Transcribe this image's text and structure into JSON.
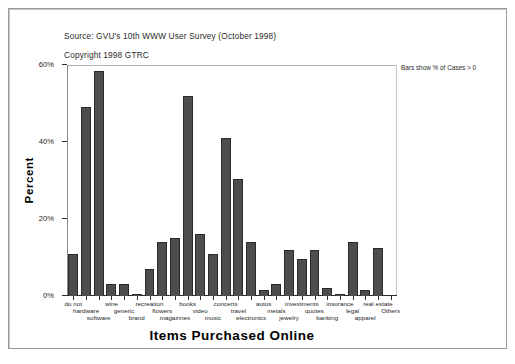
{
  "figure": {
    "source_note": "Source: GVU's 10th WWW User Survey (October 1998)",
    "copyright_note": "Copyright 1998 GTRC",
    "footnote": "Bars show % of Cases > 0"
  },
  "chart_data": {
    "type": "bar",
    "title": "",
    "xlabel": "Items Purchased Online",
    "ylabel": "Percent",
    "ylim": [
      0,
      60
    ],
    "ytick_labels": [
      "0%",
      "20%",
      "40%",
      "60%"
    ],
    "ytick_values": [
      0,
      20,
      40,
      60
    ],
    "grid": false,
    "legend": "none",
    "bar_color": "#4d4d4d",
    "bar_edge_color": "#2a2a2a",
    "annotation": "Bars show % of Cases > 0",
    "categories": [
      "do not",
      "hardware",
      "software",
      "wine",
      "generic",
      "brand",
      "recreation",
      "flowers",
      "magazines",
      "books",
      "video",
      "music",
      "concerts",
      "travel",
      "electronics",
      "autos",
      "metals",
      "jewelry",
      "investments",
      "quotes",
      "banking",
      "insurance",
      "legal",
      "apparel",
      "real estate",
      "Others"
    ],
    "values": [
      11.0,
      49.0,
      58.5,
      3.0,
      3.0,
      0.4,
      7.0,
      14.0,
      15.0,
      52.0,
      16.0,
      11.0,
      41.0,
      30.5,
      14.0,
      1.5,
      3.0,
      12.0,
      9.5,
      12.0,
      2.0,
      0.6,
      14.0,
      1.5,
      12.5,
      0.0
    ],
    "label_rows": [
      {
        "row": 0,
        "labels": [
          "do not",
          "wine",
          "recreation",
          "books",
          "concerts",
          "autos",
          "investments",
          "insurance",
          "real estate"
        ]
      },
      {
        "row": 1,
        "labels": [
          "hardware",
          "generic",
          "flowers",
          "video",
          "travel",
          "metals",
          "quotes",
          "legal",
          "Others"
        ]
      },
      {
        "row": 2,
        "labels": [
          "software",
          "brand",
          "magazines",
          "music",
          "electronics",
          "jewelry",
          "banking",
          "apparel"
        ]
      }
    ]
  }
}
